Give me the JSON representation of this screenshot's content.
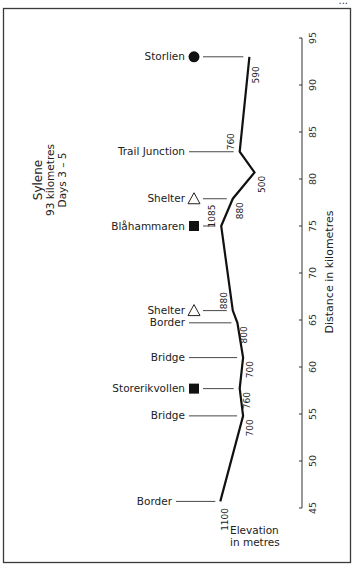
{
  "header": {
    "cut_off_text": "..."
  },
  "chart_data": {
    "type": "line",
    "orientation": "vertical-profile",
    "title": "Sylene",
    "subtitle_lines": [
      "93 kilometres",
      "Days 3 – 5"
    ],
    "xlabel": "Elevation in metres",
    "xlabel_lines": [
      "Elevation",
      "in metres"
    ],
    "ylabel": "Distance in kilometres",
    "ylim": [
      45,
      95
    ],
    "yticks": [
      45,
      50,
      55,
      60,
      65,
      70,
      75,
      80,
      85,
      90,
      95
    ],
    "ytick_labels": [
      "45",
      "50",
      "55",
      "60",
      "65",
      "70",
      "75",
      "80",
      "85",
      "90",
      "95"
    ],
    "grid": false,
    "points": [
      {
        "distance_km": 93.0,
        "elevation_m": 590,
        "waypoint": "Storlien",
        "marker": "circle",
        "elevation_label": "590",
        "label_side": "right"
      },
      {
        "distance_km": 82.9,
        "elevation_m": 760,
        "waypoint": "Trail Junction",
        "marker": "none",
        "elevation_label": "760",
        "label_side": "left"
      },
      {
        "distance_km": 80.7,
        "elevation_m": 500,
        "waypoint": "",
        "marker": "none",
        "elevation_label": "500",
        "label_side": "right"
      },
      {
        "distance_km": 77.9,
        "elevation_m": 880,
        "waypoint": "Shelter",
        "marker": "triangle",
        "elevation_label": "880",
        "label_side": "right"
      },
      {
        "distance_km": 75.0,
        "elevation_m": 1085,
        "waypoint": "Blåhammaren",
        "marker": "square",
        "elevation_label": "1085",
        "label_side": "left"
      },
      {
        "distance_km": 66.0,
        "elevation_m": 880,
        "waypoint": "Shelter",
        "marker": "triangle",
        "elevation_label": "880",
        "label_side": "left"
      },
      {
        "distance_km": 64.7,
        "elevation_m": 800,
        "waypoint": "Border",
        "marker": "none",
        "elevation_label": "800",
        "label_side": "right"
      },
      {
        "distance_km": 61.0,
        "elevation_m": 700,
        "waypoint": "Bridge",
        "marker": "none",
        "elevation_label": "700",
        "label_side": "right"
      },
      {
        "distance_km": 57.7,
        "elevation_m": 760,
        "waypoint": "Storerikvollen",
        "marker": "square",
        "elevation_label": "760",
        "label_side": "right"
      },
      {
        "distance_km": 54.8,
        "elevation_m": 700,
        "waypoint": "Bridge",
        "marker": "none",
        "elevation_label": "700",
        "label_side": "right"
      },
      {
        "distance_km": 45.7,
        "elevation_m": 1100,
        "waypoint": "Border",
        "marker": "none",
        "elevation_label": "1100",
        "label_side": "below"
      }
    ]
  }
}
